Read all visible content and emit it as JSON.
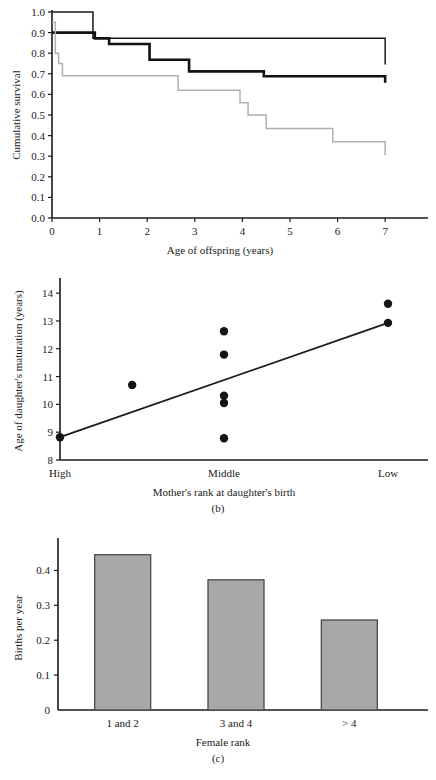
{
  "figure": {
    "panels": [
      "a",
      "b",
      "c"
    ]
  },
  "chart_data": [
    {
      "panel": "a",
      "caption": "(a)",
      "type": "line",
      "title": "",
      "xlabel": "Age of offspring (years)",
      "ylabel": "Cumulative survival",
      "xlim": [
        0,
        7.9
      ],
      "ylim": [
        0,
        1.0
      ],
      "xticks": [
        0,
        1,
        2,
        3,
        4,
        5,
        6,
        7
      ],
      "xtick_labels": [
        "0",
        "1",
        "2",
        "3",
        "4",
        "5",
        "6",
        "7"
      ],
      "yticks": [
        0.0,
        0.1,
        0.2,
        0.3,
        0.4,
        0.5,
        0.6,
        0.7,
        0.8,
        0.9,
        1.0
      ],
      "ytick_labels": [
        "0.0",
        "0.1",
        "0.2",
        "0.3",
        "0.4",
        "0.5",
        "0.6",
        "0.7",
        "0.8",
        "0.9",
        "1.0"
      ],
      "grid": false,
      "legend": "none",
      "step_style": "post",
      "series": [
        {
          "name": "high-rank",
          "style": "thin-black",
          "color": "#1a1a1a",
          "x": [
            0.0,
            0.52,
            0.86,
            1.18,
            2.88,
            7.0
          ],
          "y": [
            1.0,
            1.0,
            0.872,
            0.872,
            0.872,
            0.745
          ]
        },
        {
          "name": "middle-rank",
          "style": "thick-black",
          "color": "#121212",
          "x": [
            0.0,
            0.5,
            0.9,
            1.2,
            1.38,
            2.05,
            2.15,
            2.88,
            4.25,
            4.45,
            4.9,
            7.0
          ],
          "y": [
            0.9,
            0.9,
            0.872,
            0.845,
            0.845,
            0.768,
            0.768,
            0.712,
            0.712,
            0.688,
            0.688,
            0.657
          ]
        },
        {
          "name": "low-rank",
          "style": "gray",
          "color": "#b0b0b0",
          "x": [
            0.0,
            0.07,
            0.14,
            0.22,
            0.87,
            2.65,
            3.95,
            4.12,
            4.5,
            5.9,
            7.0
          ],
          "y": [
            0.95,
            0.8,
            0.75,
            0.69,
            0.69,
            0.62,
            0.56,
            0.5,
            0.435,
            0.37,
            0.305
          ]
        }
      ]
    },
    {
      "panel": "b",
      "caption": "(b)",
      "type": "scatter",
      "title": "",
      "xlabel": "Mother's rank at daughter's birth",
      "ylabel": "Age of daughter's maturation (years)",
      "ylim": [
        8,
        14.4
      ],
      "yticks": [
        8,
        9,
        10,
        11,
        12,
        13,
        14
      ],
      "ytick_labels": [
        "8",
        "9",
        "10",
        "11",
        "12",
        "13",
        "14"
      ],
      "xtick_labels": [
        "High",
        "Middle",
        "Low"
      ],
      "xtick_positions": [
        0.0,
        0.5,
        1.0
      ],
      "grid": false,
      "legend": "none",
      "points": [
        {
          "x": 0.0,
          "y": 8.82
        },
        {
          "x": 0.22,
          "y": 10.7
        },
        {
          "x": 0.5,
          "y": 12.63
        },
        {
          "x": 0.5,
          "y": 11.79
        },
        {
          "x": 0.5,
          "y": 10.31
        },
        {
          "x": 0.5,
          "y": 10.05
        },
        {
          "x": 0.5,
          "y": 8.78
        },
        {
          "x": 1.0,
          "y": 13.62
        },
        {
          "x": 1.0,
          "y": 12.93
        }
      ],
      "fit_line": {
        "x0": 0.0,
        "y0": 8.82,
        "x1": 1.0,
        "y1": 12.93
      }
    },
    {
      "panel": "c",
      "caption": "(c)",
      "type": "bar",
      "title": "",
      "xlabel": "Female rank",
      "ylabel": "Births per year",
      "categories": [
        "1 and 2",
        "3 and 4",
        "> 4"
      ],
      "values": [
        0.445,
        0.373,
        0.258
      ],
      "ylim": [
        0,
        0.47
      ],
      "yticks": [
        0,
        0.1,
        0.2,
        0.3,
        0.4
      ],
      "ytick_labels": [
        "0",
        "0.1",
        "0.2",
        "0.3",
        "0.4"
      ],
      "grid": false,
      "legend": "none",
      "bar_fill": "#a8a8a8",
      "bar_stroke": "#4a4a4a"
    }
  ]
}
